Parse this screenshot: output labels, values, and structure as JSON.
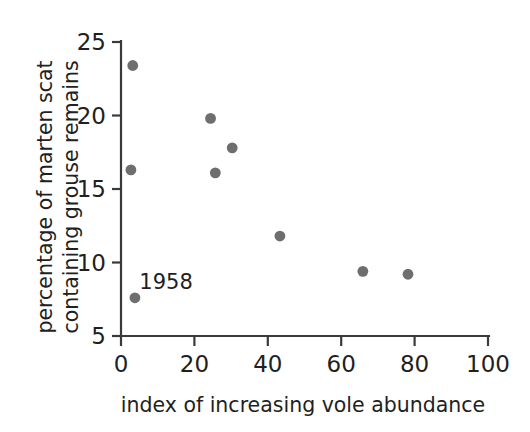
{
  "chart_data": {
    "type": "scatter",
    "title": "",
    "xlabel": "index of increasing vole abundance",
    "ylabel_line1": "percentage of marten scat",
    "ylabel_line2": "containing grouse remains",
    "xlim": [
      0,
      100
    ],
    "ylim": [
      5,
      25
    ],
    "xticks": [
      0,
      20,
      40,
      60,
      80,
      100
    ],
    "yticks": [
      5,
      10,
      15,
      20,
      25
    ],
    "xtick_labels": [
      "0",
      "20",
      "40",
      "60",
      "80",
      "100"
    ],
    "ytick_labels": [
      "5",
      "10",
      "15",
      "20",
      "25"
    ],
    "grid": false,
    "legend": "none",
    "marker_color": "#6e6e6e",
    "axis_color": "#3a3a3a",
    "points": [
      {
        "x": 3.2,
        "y": 23.4,
        "label": ""
      },
      {
        "x": 2.7,
        "y": 16.3,
        "label": ""
      },
      {
        "x": 24.4,
        "y": 19.8,
        "label": ""
      },
      {
        "x": 25.7,
        "y": 16.1,
        "label": ""
      },
      {
        "x": 30.3,
        "y": 17.8,
        "label": ""
      },
      {
        "x": 43.3,
        "y": 11.8,
        "label": ""
      },
      {
        "x": 65.9,
        "y": 9.4,
        "label": ""
      },
      {
        "x": 78.2,
        "y": 9.2,
        "label": ""
      },
      {
        "x": 3.8,
        "y": 7.6,
        "label": "1958"
      }
    ],
    "annotations": [
      {
        "text": "1958",
        "x": 5.0,
        "y": 8.2
      }
    ]
  }
}
